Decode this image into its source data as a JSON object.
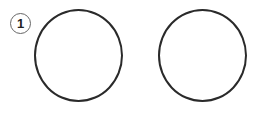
{
  "diagram": {
    "label": "1",
    "shapes": [
      {
        "type": "circle",
        "name": "left"
      },
      {
        "type": "circle",
        "name": "right"
      }
    ]
  }
}
